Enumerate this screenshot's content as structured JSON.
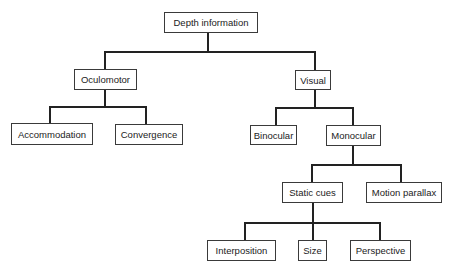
{
  "diagram": {
    "type": "tree",
    "title": "Depth information",
    "nodes": [
      {
        "id": "depth",
        "label": "Depth information",
        "x": 164,
        "y": 12,
        "w": 94,
        "h": 21
      },
      {
        "id": "oculomotor",
        "label": "Oculomotor",
        "x": 74,
        "y": 69,
        "w": 63,
        "h": 21
      },
      {
        "id": "visual",
        "label": "Visual",
        "x": 295,
        "y": 70,
        "w": 36,
        "h": 20
      },
      {
        "id": "accommodation",
        "label": "Accommodation",
        "x": 11,
        "y": 123,
        "w": 82,
        "h": 22
      },
      {
        "id": "convergence",
        "label": "Convergence",
        "x": 115,
        "y": 124,
        "w": 68,
        "h": 21
      },
      {
        "id": "binocular",
        "label": "Binocular",
        "x": 250,
        "y": 125,
        "w": 47,
        "h": 20
      },
      {
        "id": "monocular",
        "label": "Monocular",
        "x": 326,
        "y": 125,
        "w": 55,
        "h": 21
      },
      {
        "id": "static",
        "label": "Static cues",
        "x": 282,
        "y": 182,
        "w": 61,
        "h": 21
      },
      {
        "id": "motion",
        "label": "Motion parallax",
        "x": 366,
        "y": 182,
        "w": 76,
        "h": 21
      },
      {
        "id": "interposition",
        "label": "Interposition",
        "x": 207,
        "y": 240,
        "w": 69,
        "h": 21
      },
      {
        "id": "size",
        "label": "Size",
        "x": 298,
        "y": 240,
        "w": 29,
        "h": 21
      },
      {
        "id": "perspective",
        "label": "Perspective",
        "x": 350,
        "y": 240,
        "w": 61,
        "h": 21
      }
    ],
    "edges": [
      {
        "from": "depth",
        "to": "oculomotor"
      },
      {
        "from": "depth",
        "to": "visual"
      },
      {
        "from": "oculomotor",
        "to": "accommodation"
      },
      {
        "from": "oculomotor",
        "to": "convergence"
      },
      {
        "from": "visual",
        "to": "binocular"
      },
      {
        "from": "visual",
        "to": "monocular"
      },
      {
        "from": "monocular",
        "to": "static"
      },
      {
        "from": "monocular",
        "to": "motion"
      },
      {
        "from": "static",
        "to": "interposition"
      },
      {
        "from": "static",
        "to": "size"
      },
      {
        "from": "static",
        "to": "perspective"
      }
    ],
    "connectors": [
      {
        "type": "v",
        "x": 207,
        "y": 33,
        "len": 19
      },
      {
        "type": "h",
        "x": 104,
        "y": 51,
        "len": 212
      },
      {
        "type": "v",
        "x": 104,
        "y": 51,
        "len": 18
      },
      {
        "type": "v",
        "x": 314,
        "y": 51,
        "len": 19
      },
      {
        "type": "v",
        "x": 104,
        "y": 90,
        "len": 17
      },
      {
        "type": "h",
        "x": 49,
        "y": 106,
        "len": 98
      },
      {
        "type": "v",
        "x": 49,
        "y": 106,
        "len": 17
      },
      {
        "type": "v",
        "x": 145,
        "y": 106,
        "len": 18
      },
      {
        "type": "v",
        "x": 314,
        "y": 90,
        "len": 17
      },
      {
        "type": "h",
        "x": 275,
        "y": 107,
        "len": 79
      },
      {
        "type": "v",
        "x": 275,
        "y": 107,
        "len": 18
      },
      {
        "type": "v",
        "x": 352,
        "y": 107,
        "len": 18
      },
      {
        "type": "v",
        "x": 352,
        "y": 146,
        "len": 19
      },
      {
        "type": "h",
        "x": 311,
        "y": 164,
        "len": 91
      },
      {
        "type": "v",
        "x": 311,
        "y": 164,
        "len": 18
      },
      {
        "type": "v",
        "x": 400,
        "y": 164,
        "len": 18
      },
      {
        "type": "v",
        "x": 312,
        "y": 203,
        "len": 20
      },
      {
        "type": "h",
        "x": 244,
        "y": 222,
        "len": 137
      },
      {
        "type": "v",
        "x": 244,
        "y": 222,
        "len": 18
      },
      {
        "type": "v",
        "x": 312,
        "y": 222,
        "len": 18
      },
      {
        "type": "v",
        "x": 379,
        "y": 222,
        "len": 18
      }
    ]
  }
}
